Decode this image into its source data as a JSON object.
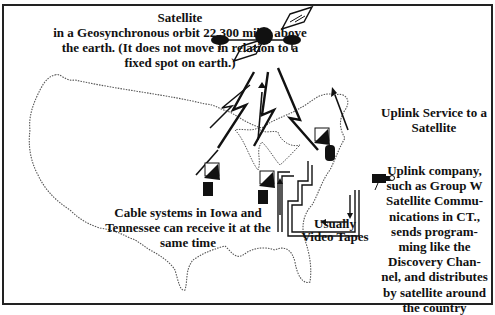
{
  "diagram": {
    "satellite": {
      "heading": "Satellite",
      "caption_lines": [
        "in a Geosynchronous orbit 22,300 miles above",
        "the earth.  (It does not move in relation to a",
        "fixed spot on earth.)"
      ]
    },
    "uplink_service": {
      "lines": [
        "Uplink Service to a",
        "Satellite"
      ]
    },
    "uplink_company": {
      "lines": [
        "Uplink company,",
        "such as Group W",
        "Satellite Commu-",
        "nications in CT.,",
        "sends program-",
        "ming like the",
        "Discovery Chan-",
        "nel, and distributes",
        "by satellite around",
        "the country"
      ]
    },
    "cable_systems": {
      "lines": [
        "Cable systems in Iowa and",
        "Tennessee can receive it at the",
        "same time"
      ]
    },
    "tapes": {
      "lines": [
        "Usually",
        "Video Tapes"
      ]
    },
    "icons": [
      "satellite-icon",
      "satellite-dish-icon",
      "video-camera-icon",
      "signal-arrow-icon",
      "us-map-outline"
    ],
    "colors": {
      "ink": "#111111",
      "background": "#ffffff",
      "map_outline": "#555555"
    }
  }
}
